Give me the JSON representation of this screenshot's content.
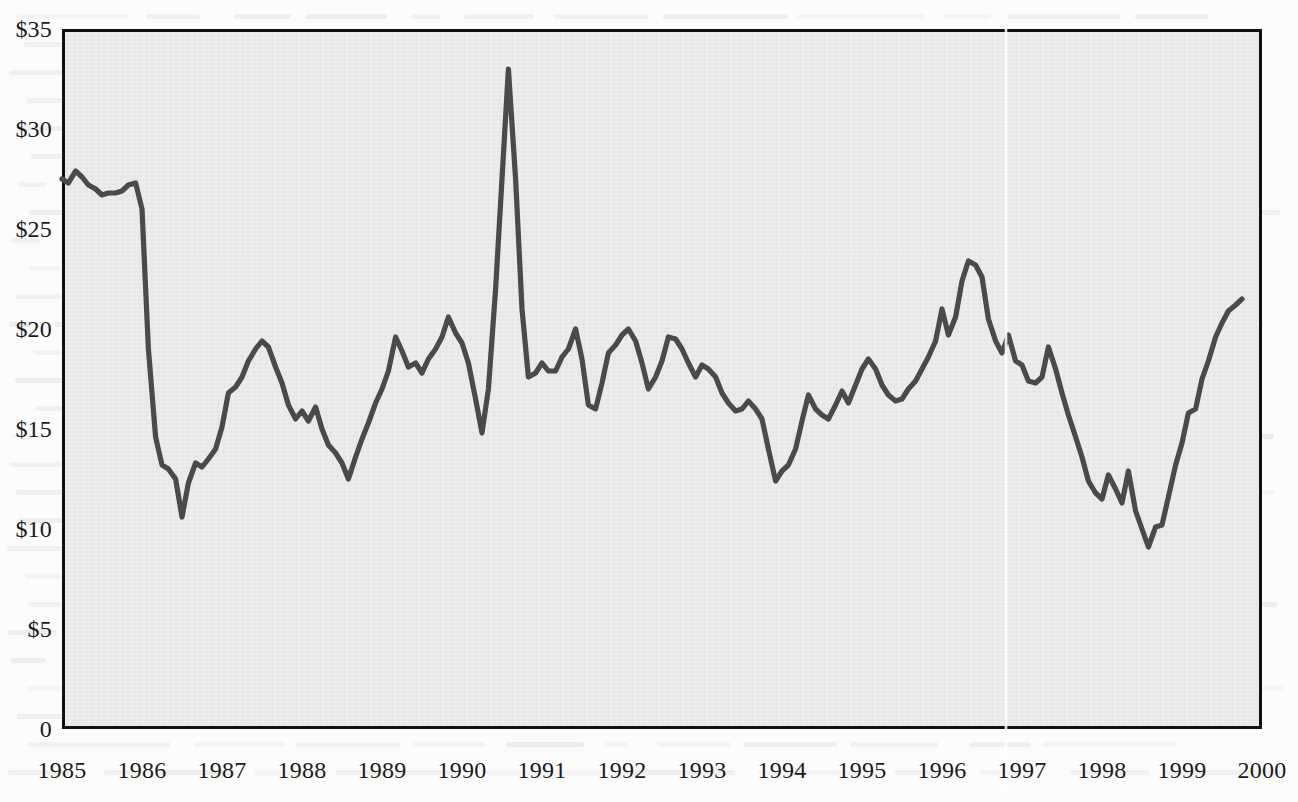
{
  "chart_data": {
    "type": "line",
    "title": "",
    "xlabel": "",
    "ylabel": "",
    "ylim": [
      0,
      35
    ],
    "xlim": [
      1985.0,
      2000.0
    ],
    "grid": false,
    "legend": "none",
    "y_tick_labels": [
      "$35",
      "$30",
      "$25",
      "$20",
      "$15",
      "$10",
      "$5",
      "0"
    ],
    "y_tick_values": [
      35,
      30,
      25,
      20,
      15,
      10,
      5,
      0
    ],
    "x_tick_labels": [
      "1985",
      "1986",
      "1987",
      "1988",
      "1989",
      "1990",
      "1991",
      "1992",
      "1993",
      "1994",
      "1995",
      "1996",
      "1997",
      "1998",
      "1999",
      "2000"
    ],
    "x_tick_values": [
      1985,
      1986,
      1987,
      1988,
      1989,
      1990,
      1991,
      1992,
      1993,
      1994,
      1995,
      1996,
      1997,
      1998,
      1999,
      2000
    ],
    "series": [
      {
        "name": "Crude oil price",
        "color": "#4a4a4a",
        "x": [
          1985.0,
          1985.08,
          1985.17,
          1985.25,
          1985.33,
          1985.42,
          1985.5,
          1985.58,
          1985.67,
          1985.75,
          1985.83,
          1985.92,
          1986.0,
          1986.08,
          1986.17,
          1986.25,
          1986.33,
          1986.42,
          1986.5,
          1986.58,
          1986.67,
          1986.75,
          1986.83,
          1986.92,
          1987.0,
          1987.08,
          1987.17,
          1987.25,
          1987.33,
          1987.42,
          1987.5,
          1987.58,
          1987.67,
          1987.75,
          1987.83,
          1987.92,
          1988.0,
          1988.08,
          1988.17,
          1988.25,
          1988.33,
          1988.42,
          1988.5,
          1988.58,
          1988.67,
          1988.75,
          1988.83,
          1988.92,
          1989.0,
          1989.08,
          1989.17,
          1989.25,
          1989.33,
          1989.42,
          1989.5,
          1989.58,
          1989.67,
          1989.75,
          1989.83,
          1989.92,
          1990.0,
          1990.08,
          1990.17,
          1990.25,
          1990.33,
          1990.42,
          1990.5,
          1990.58,
          1990.67,
          1990.75,
          1990.83,
          1990.92,
          1991.0,
          1991.08,
          1991.17,
          1991.25,
          1991.33,
          1991.42,
          1991.5,
          1991.58,
          1991.67,
          1991.75,
          1991.83,
          1991.92,
          1992.0,
          1992.08,
          1992.17,
          1992.25,
          1992.33,
          1992.42,
          1992.5,
          1992.58,
          1992.67,
          1992.75,
          1992.83,
          1992.92,
          1993.0,
          1993.08,
          1993.17,
          1993.25,
          1993.33,
          1993.42,
          1993.5,
          1993.58,
          1993.67,
          1993.75,
          1993.83,
          1993.92,
          1994.0,
          1994.08,
          1994.17,
          1994.25,
          1994.33,
          1994.42,
          1994.5,
          1994.58,
          1994.67,
          1994.75,
          1994.83,
          1994.92,
          1995.0,
          1995.08,
          1995.17,
          1995.25,
          1995.33,
          1995.42,
          1995.5,
          1995.58,
          1995.67,
          1995.75,
          1995.83,
          1995.92,
          1996.0,
          1996.08,
          1996.17,
          1996.25,
          1996.33,
          1996.42,
          1996.5,
          1996.58,
          1996.67,
          1996.75,
          1996.83,
          1996.92,
          1997.0,
          1997.08,
          1997.17,
          1997.25,
          1997.33,
          1997.42,
          1997.5,
          1997.58,
          1997.67,
          1997.75,
          1997.83,
          1997.92,
          1998.0,
          1998.08,
          1998.17,
          1998.25,
          1998.33,
          1998.42,
          1998.5,
          1998.58,
          1998.67,
          1998.75,
          1998.83,
          1998.92,
          1999.0,
          1999.08,
          1999.17,
          1999.25,
          1999.33,
          1999.42,
          1999.5,
          1999.58,
          1999.67,
          1999.75
        ],
        "values": [
          27.5,
          27.3,
          27.9,
          27.6,
          27.2,
          27.0,
          26.7,
          26.8,
          26.8,
          26.9,
          27.2,
          27.3,
          26.0,
          19.0,
          14.6,
          13.2,
          13.0,
          12.5,
          10.6,
          12.3,
          13.3,
          13.1,
          13.5,
          14.0,
          15.1,
          16.8,
          17.1,
          17.6,
          18.4,
          19.0,
          19.4,
          19.1,
          18.1,
          17.3,
          16.2,
          15.5,
          15.9,
          15.4,
          16.1,
          15.0,
          14.2,
          13.8,
          13.3,
          12.5,
          13.6,
          14.5,
          15.3,
          16.3,
          17.0,
          17.9,
          19.6,
          18.9,
          18.1,
          18.3,
          17.8,
          18.5,
          19.0,
          19.6,
          20.6,
          19.8,
          19.3,
          18.3,
          16.5,
          14.8,
          17.0,
          22.0,
          27.5,
          33.0,
          27.5,
          21.0,
          17.6,
          17.8,
          18.3,
          17.9,
          17.9,
          18.6,
          19.0,
          20.0,
          18.5,
          16.2,
          16.0,
          17.3,
          18.8,
          19.2,
          19.7,
          20.0,
          19.4,
          18.3,
          17.0,
          17.6,
          18.4,
          19.6,
          19.5,
          19.0,
          18.3,
          17.6,
          18.2,
          18.0,
          17.6,
          16.8,
          16.3,
          15.9,
          16.0,
          16.4,
          16.0,
          15.5,
          14.0,
          12.4,
          12.9,
          13.2,
          14.0,
          15.4,
          16.7,
          16.0,
          15.7,
          15.5,
          16.2,
          16.9,
          16.3,
          17.2,
          18.0,
          18.5,
          18.0,
          17.2,
          16.7,
          16.4,
          16.5,
          17.0,
          17.4,
          18.0,
          18.6,
          19.4,
          21.0,
          19.7,
          20.6,
          22.4,
          23.4,
          23.2,
          22.6,
          20.5,
          19.4,
          18.8,
          19.7,
          18.4,
          18.2,
          17.4,
          17.3,
          17.6,
          19.1,
          18.0,
          16.8,
          15.7,
          14.6,
          13.6,
          12.4,
          11.8,
          11.5,
          12.7,
          12.0,
          11.3,
          12.9,
          10.9,
          10.0,
          9.1,
          10.1,
          10.2,
          11.6,
          13.2,
          14.3,
          15.8,
          16.0,
          17.5,
          18.4,
          19.6,
          20.3,
          20.9,
          21.2,
          21.5
        ]
      }
    ]
  },
  "axes": {
    "y_ticks": [
      {
        "label": "$35",
        "value": 35
      },
      {
        "label": "$30",
        "value": 30
      },
      {
        "label": "$25",
        "value": 25
      },
      {
        "label": "$20",
        "value": 20
      },
      {
        "label": "$15",
        "value": 15
      },
      {
        "label": "$10",
        "value": 10
      },
      {
        "label": "$5",
        "value": 5
      },
      {
        "label": "0",
        "value": 0
      }
    ],
    "x_ticks": [
      {
        "label": "1985",
        "value": 1985
      },
      {
        "label": "1986",
        "value": 1986
      },
      {
        "label": "1987",
        "value": 1987
      },
      {
        "label": "1988",
        "value": 1988
      },
      {
        "label": "1989",
        "value": 1989
      },
      {
        "label": "1990",
        "value": 1990
      },
      {
        "label": "1991",
        "value": 1991
      },
      {
        "label": "1992",
        "value": 1992
      },
      {
        "label": "1993",
        "value": 1993
      },
      {
        "label": "1994",
        "value": 1994
      },
      {
        "label": "1995",
        "value": 1995
      },
      {
        "label": "1996",
        "value": 1996
      },
      {
        "label": "1997",
        "value": 1997
      },
      {
        "label": "1998",
        "value": 1998
      },
      {
        "label": "1999",
        "value": 1999
      },
      {
        "label": "2000",
        "value": 2000
      }
    ]
  },
  "style": {
    "plot_background": "#ebebeb",
    "page_background": "#fdfdfd",
    "frame_color": "#101010",
    "line_color": "#4a4a4a",
    "text_color": "#1a1a1a"
  }
}
